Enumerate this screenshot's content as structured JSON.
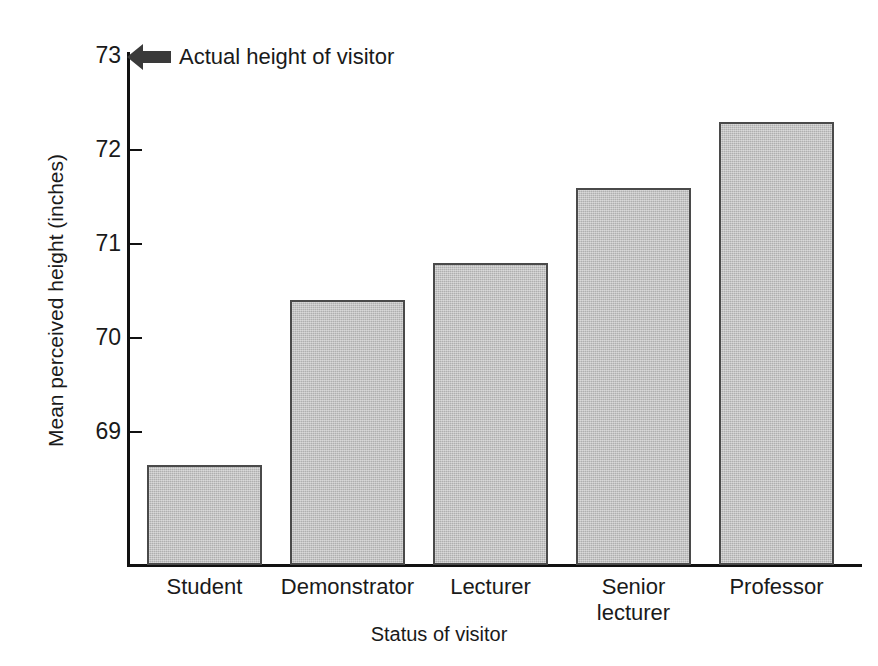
{
  "chart_data": {
    "type": "bar",
    "title": "",
    "xlabel": "Status of visitor",
    "ylabel": "Mean perceived height (inches)",
    "categories": [
      "Student",
      "Demonstrator",
      "Lecturer",
      "Senior lecturer",
      "Professor"
    ],
    "values": [
      68.65,
      70.4,
      70.8,
      71.6,
      72.3
    ],
    "ylim": [
      68.2,
      73.2
    ],
    "yticks": [
      69,
      70,
      71,
      72,
      73
    ],
    "ytick_labels": [
      "69",
      "70",
      "71",
      "72",
      "73"
    ],
    "grid": false,
    "legend": false,
    "bar_fill_color": "#b9b9b9",
    "bar_edge_color": "#4a4a4a",
    "axis_color": "#111111",
    "annotations": [
      {
        "text": "Actual height of visitor",
        "y_value": 73,
        "marker": "left-arrow",
        "marker_color": "#3a3a3a"
      }
    ]
  },
  "axis": {
    "y_ticks": [
      {
        "label": "73",
        "value": 73
      },
      {
        "label": "72",
        "value": 72
      },
      {
        "label": "71",
        "value": 71
      },
      {
        "label": "70",
        "value": 70
      },
      {
        "label": "69",
        "value": 69
      }
    ],
    "y_title": "Mean perceived height (inches)",
    "x_title": "Status of visitor"
  },
  "bars": [
    {
      "category": "Student",
      "category_line1": "Student",
      "category_line2": "",
      "value": 68.65
    },
    {
      "category": "Demonstrator",
      "category_line1": "Demonstrator",
      "category_line2": "",
      "value": 70.4
    },
    {
      "category": "Lecturer",
      "category_line1": "Lecturer",
      "category_line2": "",
      "value": 70.8
    },
    {
      "category": "Senior lecturer",
      "category_line1": "Senior",
      "category_line2": "lecturer",
      "value": 71.6
    },
    {
      "category": "Professor",
      "category_line1": "Professor",
      "category_line2": "",
      "value": 72.3
    }
  ],
  "annotation": {
    "text": "Actual height of visitor"
  }
}
